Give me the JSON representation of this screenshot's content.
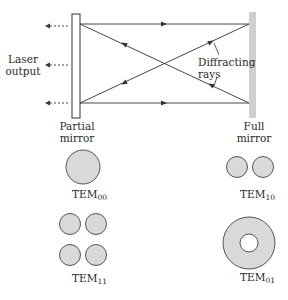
{
  "labels": {
    "laser_output_line1": "Laser",
    "laser_output_line2": "output",
    "partial_mirror_line1": "Partial",
    "partial_mirror_line2": "mirror",
    "full_mirror_line1": "Full",
    "full_mirror_line2": "mirror",
    "diffracting_line1": "Diffracting",
    "diffracting_line2": "rays"
  },
  "modes": [
    {
      "name": "TEM",
      "sub": "00"
    },
    {
      "name": "TEM",
      "sub": "10"
    },
    {
      "name": "TEM",
      "sub": "11"
    },
    {
      "name": "TEM",
      "sub": "01"
    }
  ],
  "colors": {
    "mode_fill": "#d9d9d9",
    "full_mirror_fill": "#cfcfcf",
    "stroke": "#333333"
  }
}
